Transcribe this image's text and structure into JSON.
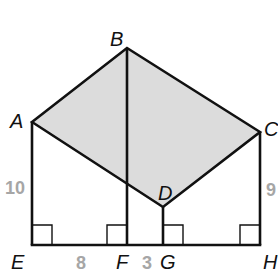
{
  "diagram": {
    "type": "geometry-figure",
    "colors": {
      "stroke": "#111111",
      "shaded_fill": "#dcdcdc",
      "length_label": "#a6a6a6",
      "background": "#ffffff"
    },
    "points": {
      "A": {
        "label": "A",
        "x": 32,
        "y": 122
      },
      "B": {
        "label": "B",
        "x": 127,
        "y": 48
      },
      "C": {
        "label": "C",
        "x": 260,
        "y": 132
      },
      "D": {
        "label": "D",
        "x": 163,
        "y": 207
      },
      "E": {
        "label": "E",
        "x": 32,
        "y": 245
      },
      "F": {
        "label": "F",
        "x": 127,
        "y": 245
      },
      "G": {
        "label": "G",
        "x": 163,
        "y": 245
      },
      "H": {
        "label": "H",
        "x": 260,
        "y": 245
      }
    },
    "shaded_region": [
      "A",
      "B",
      "C",
      "D"
    ],
    "segments": [
      [
        "A",
        "B"
      ],
      [
        "B",
        "C"
      ],
      [
        "C",
        "D"
      ],
      [
        "D",
        "A"
      ],
      [
        "A",
        "E"
      ],
      [
        "B",
        "F"
      ],
      [
        "D",
        "G"
      ],
      [
        "C",
        "H"
      ],
      [
        "E",
        "H"
      ]
    ],
    "right_angles": [
      "E",
      "F",
      "G",
      "H"
    ],
    "lengths": {
      "AE": "10",
      "EF": "8",
      "FG": "3",
      "CH": "9"
    }
  }
}
